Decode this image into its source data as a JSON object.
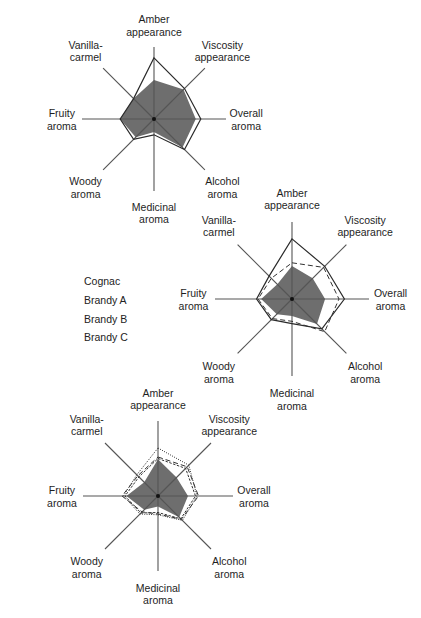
{
  "chart_data": [
    {
      "type": "radar",
      "title": "",
      "center": [
        154,
        119
      ],
      "radius": 72,
      "axes": [
        "Amber appearance",
        "Viscosity appearance",
        "Overall aroma",
        "Alcohol aroma",
        "Medicinal aroma",
        "Woody aroma",
        "Fruity aroma",
        "Vanilla-carmel"
      ],
      "series": [
        {
          "name": "Reference (filled)",
          "style": "fill",
          "values": [
            0.54,
            0.58,
            0.58,
            0.56,
            0.18,
            0.36,
            0.47,
            0.4
          ]
        },
        {
          "name": "Cognac",
          "style": "solid",
          "values": [
            0.85,
            0.6,
            0.65,
            0.6,
            0.22,
            0.4,
            0.47,
            0.4
          ]
        }
      ]
    },
    {
      "type": "radar",
      "title": "",
      "center": [
        292,
        299
      ],
      "radius": 77,
      "axes": [
        "Amber appearance",
        "Viscosity appearance",
        "Overall aroma",
        "Alcohol aroma",
        "Medicinal aroma",
        "Woody aroma",
        "Fruity aroma",
        "Vanilla-carmel"
      ],
      "series": [
        {
          "name": "Reference (filled)",
          "style": "fill",
          "values": [
            0.43,
            0.38,
            0.43,
            0.46,
            0.22,
            0.28,
            0.4,
            0.27
          ]
        },
        {
          "name": "Cognac",
          "style": "solid",
          "values": [
            0.78,
            0.6,
            0.68,
            0.55,
            0.32,
            0.38,
            0.46,
            0.42
          ]
        },
        {
          "name": "Brandy C",
          "style": "dashed",
          "values": [
            0.47,
            0.58,
            0.61,
            0.6,
            0.29,
            0.36,
            0.44,
            0.38
          ]
        }
      ]
    },
    {
      "type": "radar",
      "title": "",
      "center": [
        158,
        496
      ],
      "radius": 75,
      "axes": [
        "Amber appearance",
        "Viscosity appearance",
        "Overall aroma",
        "Alcohol aroma",
        "Medicinal aroma",
        "Woody aroma",
        "Fruity aroma",
        "Vanilla-carmel"
      ],
      "series": [
        {
          "name": "Reference (filled)",
          "style": "fill",
          "values": [
            0.49,
            0.35,
            0.4,
            0.4,
            0.14,
            0.26,
            0.42,
            0.26
          ]
        },
        {
          "name": "Brandy A",
          "style": "dotted",
          "values": [
            0.64,
            0.58,
            0.52,
            0.46,
            0.25,
            0.34,
            0.46,
            0.4
          ]
        },
        {
          "name": "Brandy B",
          "style": "dashed-fine",
          "values": [
            0.5,
            0.52,
            0.5,
            0.43,
            0.22,
            0.32,
            0.44,
            0.36
          ]
        },
        {
          "name": "Brandy C",
          "style": "dashed",
          "values": [
            0.52,
            0.55,
            0.54,
            0.44,
            0.24,
            0.3,
            0.48,
            0.38
          ]
        }
      ]
    }
  ],
  "legend": {
    "items": [
      {
        "label": "Cognac",
        "style": "solid"
      },
      {
        "label": "Brandy A",
        "style": "dotted"
      },
      {
        "label": "Brandy B",
        "style": "dashed-fine"
      },
      {
        "label": "Brandy C",
        "style": "dashed"
      }
    ]
  },
  "axis_labels": [
    "Amber\nappearance",
    "Viscosity\nappearance",
    "Overall\naroma",
    "Alcohol\naroma",
    "Medicinal\naroma",
    "Woody\naroma",
    "Fruity\naroma",
    "Vanilla-\ncarmel"
  ],
  "colors": {
    "fill": "#6e6e6e",
    "line": "#333333",
    "axis": "#555555"
  }
}
